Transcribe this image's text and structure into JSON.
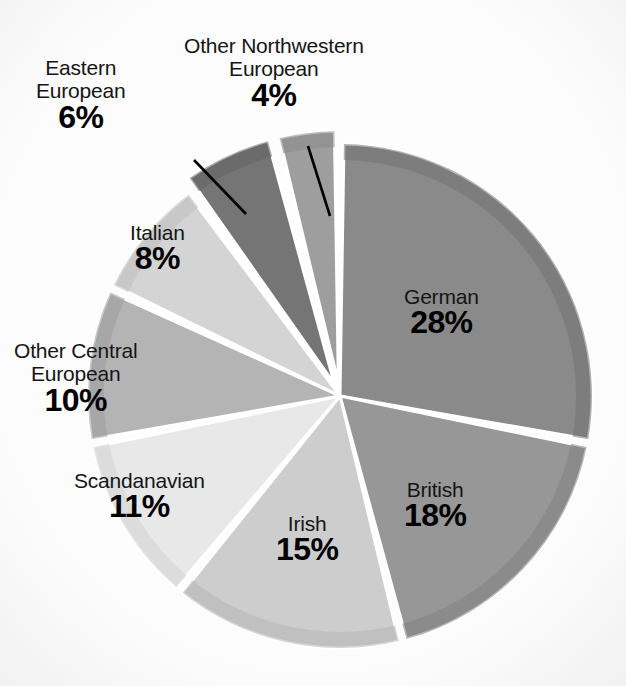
{
  "chart_data": {
    "type": "pie",
    "title": "",
    "subtitle": "",
    "xlabel": "",
    "ylabel": "",
    "legend_position": "none",
    "grid": false,
    "units": "percent",
    "total": 100,
    "categories": [
      "German",
      "British",
      "Irish",
      "Scandanavian",
      "Other Central European",
      "Italian",
      "Eastern European",
      "Other Northwestern European"
    ],
    "values": [
      28,
      18,
      15,
      11,
      10,
      8,
      6,
      4
    ],
    "slices": [
      {
        "label": "German",
        "value": 28,
        "value_text": "28%",
        "color": "#8a8a8a",
        "rim_color": "#737373",
        "exploded": false,
        "leader_line": false
      },
      {
        "label": "British",
        "value": 18,
        "value_text": "18%",
        "color": "#979797",
        "rim_color": "#828282",
        "exploded": false,
        "leader_line": false
      },
      {
        "label": "Irish",
        "value": 15,
        "value_text": "15%",
        "color": "#cdcdcd",
        "rim_color": "#b6b6b6",
        "exploded": false,
        "leader_line": false
      },
      {
        "label": "Scandanavian",
        "value": 11,
        "value_text": "11%",
        "color": "#e8e8e8",
        "rim_color": "#d2d2d2",
        "exploded": false,
        "leader_line": false
      },
      {
        "label": "Other Central European",
        "value": 10,
        "value_text": "10%",
        "color": "#b4b4b4",
        "rim_color": "#9d9d9d",
        "exploded": false,
        "leader_line": false
      },
      {
        "label": "Italian",
        "value": 8,
        "value_text": "8%",
        "color": "#d4d4d4",
        "rim_color": "#bdbdbd",
        "exploded": false,
        "leader_line": false
      },
      {
        "label": "Eastern European",
        "value": 6,
        "value_text": "6%",
        "color": "#757575",
        "rim_color": "#636363",
        "exploded": true,
        "leader_line": true
      },
      {
        "label": "Other Northwestern European",
        "value": 4,
        "value_text": "4%",
        "color": "#9e9e9e",
        "rim_color": "#8a8a8a",
        "exploded": true,
        "leader_line": true
      }
    ]
  },
  "labels": {
    "german": {
      "name": "German",
      "pct": "28%"
    },
    "british": {
      "name": "British",
      "pct": "18%"
    },
    "irish": {
      "name": "Irish",
      "pct": "15%"
    },
    "scandanavian": {
      "name": "Scandanavian",
      "pct": "11%"
    },
    "other_central": {
      "name_line1": "Other Central",
      "name_line2": "European",
      "pct": "10%"
    },
    "italian": {
      "name": "Italian",
      "pct": "8%"
    },
    "eastern": {
      "name_line1": "Eastern",
      "name_line2": "European",
      "pct": "6%"
    },
    "other_nw": {
      "name_line1": "Other Northwestern",
      "name_line2": "European",
      "pct": "4%"
    }
  },
  "colors": {
    "background": "#fdfdfd",
    "slice_separator": "#ffffff",
    "text": "#111111",
    "leader_line": "#000000"
  }
}
